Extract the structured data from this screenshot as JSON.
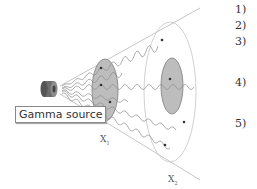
{
  "diagram": {
    "source_label": "Gamma source",
    "x1_label": "X",
    "x1_sub": "1",
    "x2_label": "X",
    "x2_sub": "2",
    "colors": {
      "line": "#b5b5b5",
      "wave": "#8a8a8a",
      "ellipse_fill": "#bcbcbc",
      "ellipse_stroke": "#777777",
      "source_body": "#6f6f6f"
    }
  },
  "list": {
    "items": [
      {
        "label": "1)"
      },
      {
        "label": "2)"
      },
      {
        "label": "3)"
      },
      {
        "label": "4)"
      },
      {
        "label": "5)"
      }
    ]
  }
}
